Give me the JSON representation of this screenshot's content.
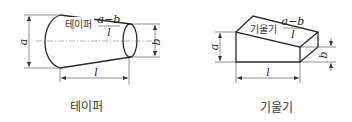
{
  "figures": [
    {
      "id": "taper",
      "caption": "테이퍼",
      "ratio_label": "테이퍼",
      "formula": {
        "numerator": "a−b",
        "denominator": "l"
      },
      "dims": {
        "a": "a",
        "b": "b",
        "l": "l"
      }
    },
    {
      "id": "slope",
      "caption": "기울기",
      "ratio_label": "기울기",
      "formula": {
        "numerator": "a−b",
        "denominator": "l"
      },
      "dims": {
        "a": "a",
        "b": "b",
        "l": "l"
      }
    }
  ]
}
